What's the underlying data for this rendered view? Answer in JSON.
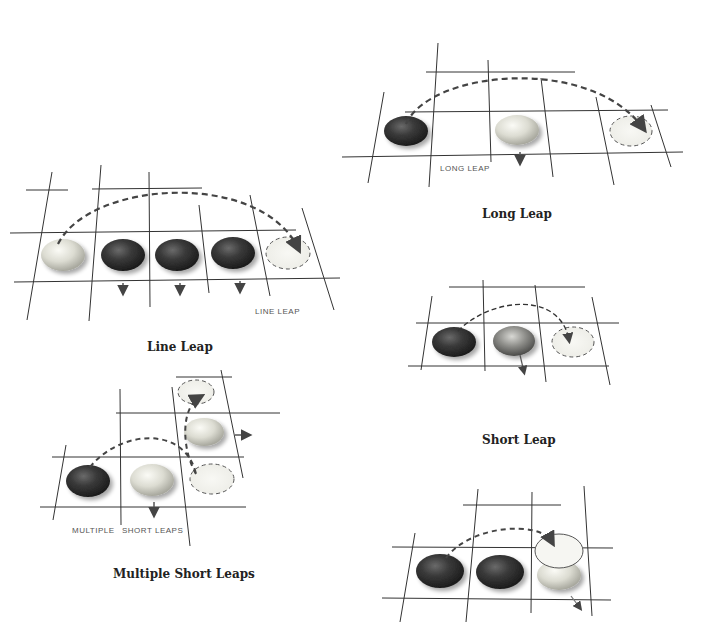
{
  "diagrams": {
    "long_leap": {
      "caption": "Long Leap",
      "label": "Long Leap"
    },
    "line_leap": {
      "caption": "Line Leap",
      "label": "Line Leap"
    },
    "short_leap": {
      "caption": "Short Leap"
    },
    "multiple_short_leaps": {
      "caption": "Multiple Short Leaps",
      "label_left": "Multiple",
      "label_right": "Short Leaps"
    },
    "final_example": {
      "caption": ""
    }
  },
  "colors": {
    "grid_line": "#333333",
    "arrow": "#555555",
    "dark_stone": "#2e2e2e",
    "light_stone": "#d8d8cc",
    "mid_stone": "#8a8a86"
  }
}
